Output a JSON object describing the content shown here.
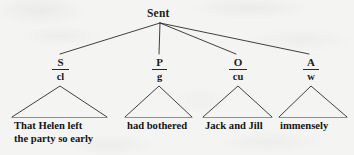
{
  "diagram": {
    "type": "sentence-constituent-tree",
    "title": "Sent",
    "background_color": "#f4f4f3",
    "ink_color": "#1d1d1d",
    "root": {
      "label": "Sent",
      "x": 160,
      "y": 14
    },
    "branches": [
      {
        "id": "subject",
        "function_label": "S",
        "form_label": "cl",
        "text_lines": [
          "That Helen left",
          "the party so early"
        ],
        "label_x": 60,
        "label_y": 58,
        "triangle": {
          "apex_x": 60,
          "apex_y": 86,
          "left_x": 12,
          "right_x": 107,
          "base_y": 117
        },
        "text_x": 14,
        "text_y": 120
      },
      {
        "id": "predicator",
        "function_label": "P",
        "form_label": "g",
        "text_lines": [
          "had bothered"
        ],
        "label_x": 159,
        "label_y": 58,
        "triangle": {
          "apex_x": 159,
          "apex_y": 86,
          "left_x": 125,
          "right_x": 192,
          "base_y": 117
        },
        "text_x": 127,
        "text_y": 120
      },
      {
        "id": "object",
        "function_label": "O",
        "form_label": "cu",
        "text_lines": [
          "Jack and Jill"
        ],
        "label_x": 238,
        "label_y": 58,
        "triangle": {
          "apex_x": 238,
          "apex_y": 86,
          "left_x": 203,
          "right_x": 272,
          "base_y": 117
        },
        "text_x": 205,
        "text_y": 120
      },
      {
        "id": "adverbial",
        "function_label": "A",
        "form_label": "w",
        "text_lines": [
          "immensely"
        ],
        "label_x": 311,
        "label_y": 58,
        "triangle": {
          "apex_x": 311,
          "apex_y": 86,
          "left_x": 279,
          "right_x": 347,
          "base_y": 117
        },
        "text_x": 280,
        "text_y": 120
      }
    ]
  }
}
